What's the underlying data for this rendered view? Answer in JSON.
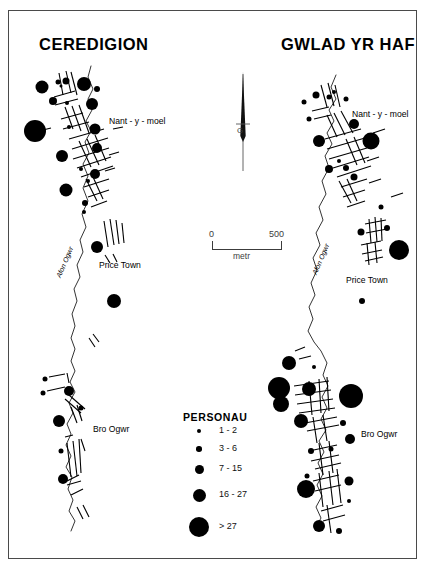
{
  "figure": {
    "title_left": "CEREDIGION",
    "title_right": "GWLAD YR HAF"
  },
  "north_arrow": {
    "label": "G"
  },
  "scale_bar": {
    "min": "0",
    "max": "500",
    "unit": "metr"
  },
  "legend": {
    "title": "PERSONAU",
    "classes": [
      {
        "label": "1  -  2",
        "dot_px": 4
      },
      {
        "label": "3  -  6",
        "dot_px": 5.5
      },
      {
        "label": "7  -  15",
        "dot_px": 9
      },
      {
        "label": "16  -  27",
        "dot_px": 13
      },
      {
        "label": "> 27",
        "dot_px": 20
      }
    ]
  },
  "map_left": {
    "name": "CEREDIGION",
    "place_labels": [
      {
        "text": "Nant - y - moel",
        "x": 100,
        "y": 105
      },
      {
        "text": "Price Town",
        "x": 92,
        "y": 254
      },
      {
        "text": "Bro Ogwr",
        "x": 86,
        "y": 418
      }
    ],
    "river_label": {
      "text": "Afon Ogwr",
      "x": 56,
      "y": 262
    },
    "dots": [
      {
        "cx": 33,
        "cy": 76,
        "r": 6.5
      },
      {
        "cx": 49,
        "cy": 71,
        "r": 2.5
      },
      {
        "cx": 52,
        "cy": 75,
        "r": 1.5
      },
      {
        "cx": 57,
        "cy": 70,
        "r": 3.5
      },
      {
        "cx": 75,
        "cy": 73,
        "r": 7
      },
      {
        "cx": 88,
        "cy": 78,
        "r": 3
      },
      {
        "cx": 44,
        "cy": 90,
        "r": 4
      },
      {
        "cx": 58,
        "cy": 92,
        "r": 2
      },
      {
        "cx": 83,
        "cy": 93,
        "r": 6
      },
      {
        "cx": 26,
        "cy": 120,
        "r": 11
      },
      {
        "cx": 60,
        "cy": 116,
        "r": 2
      },
      {
        "cx": 86,
        "cy": 118,
        "r": 5.5
      },
      {
        "cx": 53,
        "cy": 145,
        "r": 6
      },
      {
        "cx": 88,
        "cy": 137,
        "r": 5
      },
      {
        "cx": 72,
        "cy": 158,
        "r": 2
      },
      {
        "cx": 79,
        "cy": 170,
        "r": 2
      },
      {
        "cx": 86,
        "cy": 163,
        "r": 5
      },
      {
        "cx": 57,
        "cy": 179,
        "r": 6.5
      },
      {
        "cx": 76,
        "cy": 192,
        "r": 3
      },
      {
        "cx": 75,
        "cy": 201,
        "r": 2
      },
      {
        "cx": 88,
        "cy": 236,
        "r": 6
      },
      {
        "cx": 105,
        "cy": 290,
        "r": 7
      },
      {
        "cx": 36,
        "cy": 368,
        "r": 2.5
      },
      {
        "cx": 34,
        "cy": 382,
        "r": 2.5
      },
      {
        "cx": 60,
        "cy": 380,
        "r": 5
      },
      {
        "cx": 72,
        "cy": 397,
        "r": 2.5
      },
      {
        "cx": 50,
        "cy": 410,
        "r": 6
      },
      {
        "cx": 52,
        "cy": 440,
        "r": 2.5
      },
      {
        "cx": 54,
        "cy": 468,
        "r": 5
      }
    ]
  },
  "map_right": {
    "name": "GWLAD YR HAF",
    "place_labels": [
      {
        "text": "Nant - y - moel",
        "x": 350,
        "y": 103
      },
      {
        "text": "Price Town",
        "x": 343,
        "y": 270
      },
      {
        "text": "Bro Ogwr",
        "x": 358,
        "y": 424
      }
    ],
    "river_label": {
      "text": "Afon Ogwr",
      "x": 312,
      "y": 258
    },
    "dots": [
      {
        "cx": 295,
        "cy": 91,
        "r": 2.5
      },
      {
        "cx": 307,
        "cy": 84,
        "r": 3.5
      },
      {
        "cx": 320,
        "cy": 86,
        "r": 2.5
      },
      {
        "cx": 325,
        "cy": 81,
        "r": 2
      },
      {
        "cx": 337,
        "cy": 88,
        "r": 2.5
      },
      {
        "cx": 300,
        "cy": 108,
        "r": 2.5
      },
      {
        "cx": 345,
        "cy": 113,
        "r": 5
      },
      {
        "cx": 310,
        "cy": 130,
        "r": 6
      },
      {
        "cx": 362,
        "cy": 130,
        "r": 8.5
      },
      {
        "cx": 330,
        "cy": 150,
        "r": 2
      },
      {
        "cx": 320,
        "cy": 158,
        "r": 4
      },
      {
        "cx": 337,
        "cy": 157,
        "r": 3
      },
      {
        "cx": 345,
        "cy": 166,
        "r": 3.5
      },
      {
        "cx": 372,
        "cy": 196,
        "r": 2.5
      },
      {
        "cx": 352,
        "cy": 221,
        "r": 3.5
      },
      {
        "cx": 378,
        "cy": 217,
        "r": 3
      },
      {
        "cx": 390,
        "cy": 239,
        "r": 10
      },
      {
        "cx": 353,
        "cy": 290,
        "r": 3
      },
      {
        "cx": 280,
        "cy": 352,
        "r": 7
      },
      {
        "cx": 305,
        "cy": 356,
        "r": 2
      },
      {
        "cx": 300,
        "cy": 378,
        "r": 7
      },
      {
        "cx": 270,
        "cy": 377,
        "r": 11
      },
      {
        "cx": 272,
        "cy": 393,
        "r": 8
      },
      {
        "cx": 342,
        "cy": 385,
        "r": 12
      },
      {
        "cx": 292,
        "cy": 410,
        "r": 7
      },
      {
        "cx": 334,
        "cy": 412,
        "r": 3
      },
      {
        "cx": 341,
        "cy": 428,
        "r": 5
      },
      {
        "cx": 302,
        "cy": 440,
        "r": 3
      },
      {
        "cx": 322,
        "cy": 438,
        "r": 2.5
      },
      {
        "cx": 298,
        "cy": 465,
        "r": 2.5
      },
      {
        "cx": 340,
        "cy": 470,
        "r": 4.5
      },
      {
        "cx": 297,
        "cy": 478,
        "r": 9
      },
      {
        "cx": 340,
        "cy": 490,
        "r": 2
      },
      {
        "cx": 310,
        "cy": 515,
        "r": 6
      },
      {
        "cx": 330,
        "cy": 520,
        "r": 3
      }
    ]
  }
}
